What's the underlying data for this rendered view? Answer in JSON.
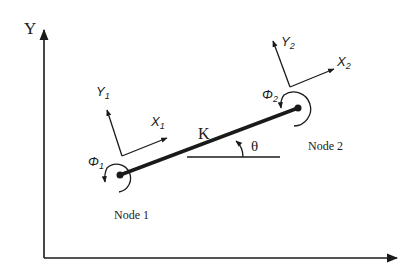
{
  "diagram": {
    "type": "beam-element-stiffness",
    "global_axes": {
      "y_label": "Y",
      "x_label": ""
    },
    "element": {
      "stiffness_label": "K",
      "angle_label": "θ"
    },
    "nodes": [
      {
        "label": "Node 1",
        "local_x_label": "X",
        "local_x_sub": "1",
        "local_y_label": "Y",
        "local_y_sub": "1",
        "rotation_label": "Φ",
        "rotation_sub": "1"
      },
      {
        "label": "Node 2",
        "local_x_label": "X",
        "local_x_sub": "2",
        "local_y_label": "Y",
        "local_y_sub": "2",
        "rotation_label": "Φ",
        "rotation_sub": "2"
      }
    ],
    "colors": {
      "ink": "#1a1a1a",
      "background": "#ffffff"
    }
  }
}
